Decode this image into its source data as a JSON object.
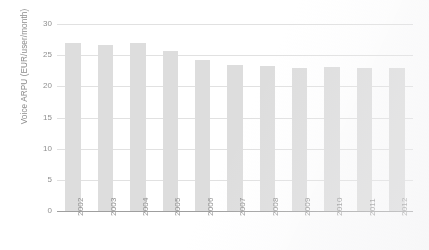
{
  "chart_data": {
    "type": "bar",
    "title": "",
    "xlabel": "",
    "ylabel": "Voice ARPU (EUR/user/month)",
    "categories": [
      "2002",
      "2003",
      "2004",
      "2005",
      "2006",
      "2007",
      "2008",
      "2009",
      "2010",
      "2011",
      "2012"
    ],
    "values": [
      26.9,
      26.6,
      26.9,
      25.6,
      24.3,
      23.5,
      23.2,
      22.9,
      23.1,
      22.9,
      23.0
    ],
    "ylim": [
      0,
      30
    ],
    "yticks": [
      0,
      5,
      10,
      15,
      20,
      25,
      30
    ],
    "ytick_labels": [
      "0",
      "5",
      "10",
      "15",
      "20",
      "25",
      "30"
    ],
    "grid": true,
    "legend": false,
    "legend_position": "none",
    "series": [
      {
        "name": "Voice ARPU",
        "values": [
          26.9,
          26.6,
          26.9,
          25.6,
          24.3,
          23.5,
          23.2,
          22.9,
          23.1,
          22.9,
          23.0
        ],
        "color": "#dedede"
      }
    ]
  },
  "colors": {
    "bar_fill": "#dedede",
    "gridline": "#e2e2e2",
    "axis_line": "#9d9d9d",
    "tick_text": "#8c8c8c",
    "background": "#ffffff"
  }
}
